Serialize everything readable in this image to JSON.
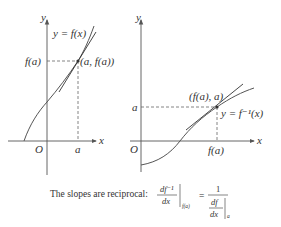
{
  "colors": {
    "axis": "#555555",
    "curve": "#555555",
    "tangent": "#333333",
    "dashed": "#666666",
    "text": "#333333",
    "background": "#ffffff"
  },
  "left_graph": {
    "axis_x_label": "x",
    "axis_y_label": "y",
    "origin_label": "O",
    "x_tick_label": "a",
    "y_tick_label": "f(a)",
    "curve_label": "y = f(x)",
    "point_label": "(a, f(a))"
  },
  "right_graph": {
    "axis_x_label": "x",
    "axis_y_label": "y",
    "origin_label": "O",
    "x_tick_label": "f(a)",
    "y_tick_label": "a",
    "curve_label": "y = f⁻¹(x)",
    "point_label": "(f(a), a)"
  },
  "caption": {
    "text": "The slopes are reciprocal:",
    "lhs_numerator": "df⁻¹",
    "lhs_denominator": "dx",
    "lhs_eval": "f(a)",
    "equals": "=",
    "rhs_numerator": "1",
    "rhs_inner_numerator": "df",
    "rhs_inner_denominator": "dx",
    "rhs_eval": "a"
  }
}
